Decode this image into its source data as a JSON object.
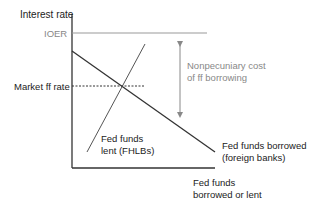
{
  "diagram": {
    "y_axis_label": "Interest rate",
    "x_axis_label_line1": "Fed funds",
    "x_axis_label_line2": "borrowed or lent",
    "ioer_label": "IOER",
    "market_rate_label": "Market ff rate",
    "annotation_line1": "Nonpecuniary cost",
    "annotation_line2": "of ff borrowing",
    "supply_label_line1": "Fed funds",
    "supply_label_line2": "lent (FHLBs)",
    "demand_label_line1": "Fed funds borrowed",
    "demand_label_line2": "(foreign banks)",
    "colors": {
      "axis": "#333333",
      "ioer_line": "#999999",
      "demand_line": "#333333",
      "supply_line": "#555555",
      "market_rate_line": "#333333",
      "arrow": "#888888",
      "gray_text": "#888888"
    }
  }
}
